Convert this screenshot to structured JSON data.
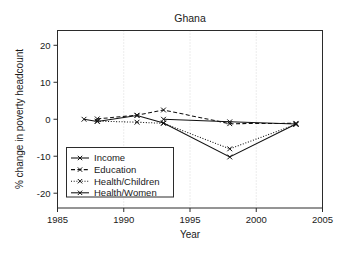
{
  "chart_data": {
    "type": "line",
    "title": "Ghana",
    "xlabel": "Year",
    "ylabel": "% change in poverty headcount",
    "xlim": [
      1985,
      2005
    ],
    "ylim": [
      -24,
      24
    ],
    "xticks": [
      1985,
      1990,
      1995,
      2000,
      2005
    ],
    "xtick_labels": [
      "1985",
      "1990",
      "1995",
      "2000",
      "2005"
    ],
    "yticks": [
      20,
      10,
      0,
      -10,
      -20
    ],
    "ytick_labels": [
      "20",
      "10",
      "0",
      "-10",
      "-20"
    ],
    "grid": "vertical-dotted-at-xticks",
    "legend_position": "lower-left-inside",
    "marker": "x",
    "series": [
      {
        "name": "Income",
        "line_style": "solid",
        "x": [
          1987,
          1988,
          1991,
          1993,
          1998,
          2003
        ],
        "values": [
          0.0,
          -0.6,
          1.0,
          -1.0,
          -10.2,
          -1.3
        ]
      },
      {
        "name": "Education",
        "line_style": "dashed",
        "x": [
          1988,
          1991,
          1993,
          1998,
          2003
        ],
        "values": [
          0.1,
          1.1,
          2.5,
          -1.2,
          -1.1
        ]
      },
      {
        "name": "Health/Children",
        "line_style": "dotted",
        "x": [
          1988,
          1991,
          1993,
          1998,
          2003
        ],
        "values": [
          -0.5,
          -0.8,
          -1.1,
          -8.0,
          -1.4
        ]
      },
      {
        "name": "Health/Women",
        "line_style": "solid",
        "x": [
          1993,
          1998,
          2003
        ],
        "values": [
          0.0,
          -0.7,
          -1.3
        ]
      }
    ]
  },
  "legend": {
    "entries": [
      {
        "label": "Income"
      },
      {
        "label": "Education"
      },
      {
        "label": "Health/Children"
      },
      {
        "label": "Health/Women"
      }
    ]
  }
}
